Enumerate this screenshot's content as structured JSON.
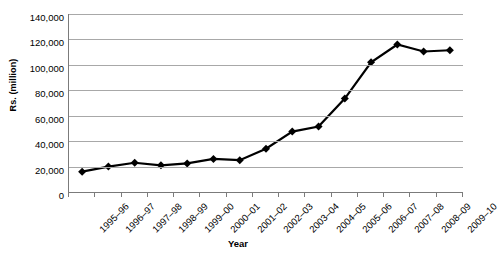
{
  "chart_data": {
    "type": "line",
    "title": "",
    "xlabel": "Year",
    "ylabel": "Rs. (million)",
    "ylim": [
      0,
      140000
    ],
    "yticks": [
      140000,
      120000,
      100000,
      80000,
      60000,
      40000,
      20000,
      0
    ],
    "ytick_labels": [
      "140,000",
      "120,000",
      "100,000",
      "80,000",
      "60,000",
      "40,000",
      "20,000",
      "0"
    ],
    "grid": true,
    "legend": "none",
    "marker": "diamond",
    "series_color": "#000000",
    "categories": [
      "1995–96",
      "1996–97",
      "1997–98",
      "1998–99",
      "1999–00",
      "2000–01",
      "2001–02",
      "2002–03",
      "2003–04",
      "2004–05",
      "2005–06",
      "2006–07",
      "2007–08",
      "2008–09",
      "2009–10"
    ],
    "values": [
      16000,
      20000,
      23000,
      21000,
      22500,
      26000,
      25000,
      34000,
      47500,
      51500,
      73500,
      102000,
      116000,
      110500,
      111500
    ]
  },
  "axis": {
    "y_title": "Rs. (million)",
    "x_title": "Year"
  },
  "header": {
    "clipped_title": ""
  }
}
